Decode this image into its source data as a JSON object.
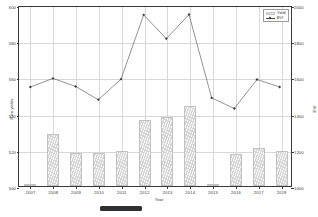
{
  "chart_data": {
    "type": "bar",
    "title": "",
    "xlabel": "Year",
    "ylabel": "Rice yields",
    "ylabel_right": "EVI",
    "categories": [
      "2007",
      "2008",
      "2009",
      "2010",
      "2011",
      "2012",
      "2013",
      "2014",
      "2015",
      "2016",
      "2017",
      "2018"
    ],
    "ylim": [
      500,
      600
    ],
    "ylim_right": [
      1000,
      2000
    ],
    "yticks": [
      600,
      580,
      560,
      540,
      520,
      500
    ],
    "yticks_right": [
      2000,
      1800,
      1600,
      1400,
      1200,
      1000
    ],
    "grid": true,
    "legend_position": "top-right",
    "series": [
      {
        "name": "Yield",
        "type": "bar",
        "axis": "left",
        "values": [
          500.5,
          529.0,
          518.0,
          518.0,
          519.5,
          536.5,
          538.0,
          544.0,
          500.8,
          517.5,
          521.0,
          519.5
        ]
      },
      {
        "name": "EVI",
        "type": "line",
        "axis": "right",
        "values": [
          1553,
          1601,
          1556,
          1482,
          1597,
          1956,
          1823,
          1958,
          1492,
          1433,
          1595,
          1553
        ]
      }
    ]
  },
  "axes": {
    "x_title": "Year",
    "y_left_title": "Rice yields",
    "y_right_title": "EVI"
  },
  "legend": {
    "items": [
      {
        "label": "Yield",
        "marker": "bar-swatch"
      },
      {
        "label": "EVI",
        "marker": "line-marker-swatch"
      }
    ]
  }
}
